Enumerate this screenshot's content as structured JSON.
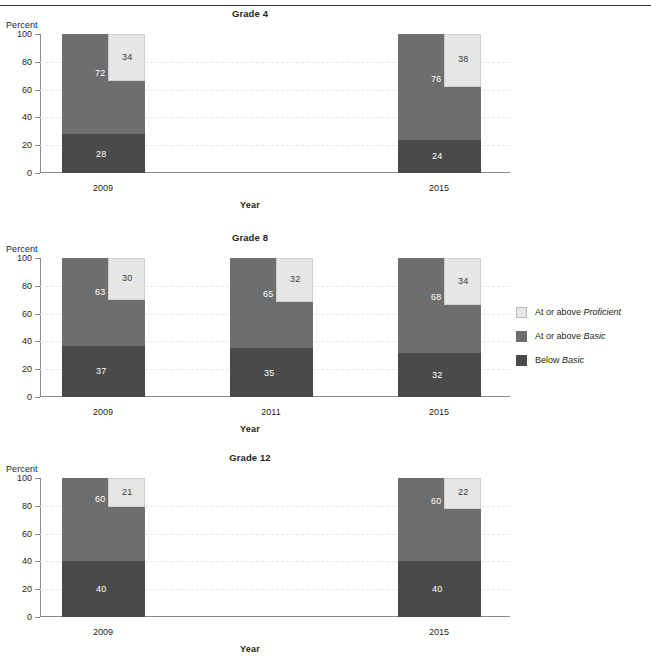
{
  "header": {
    "cut_text": ""
  },
  "legend": {
    "position": "right",
    "items": [
      {
        "id": "proficient",
        "label_plain": "At or above ",
        "label_italic": "Proficient",
        "color": "#e6e6e6",
        "swatch": "sw-prof"
      },
      {
        "id": "basic",
        "label_plain": "At or above ",
        "label_italic": "Basic",
        "color": "#6e6e6e",
        "swatch": "sw-basic"
      },
      {
        "id": "below",
        "label_plain": "Below ",
        "label_italic": "Basic",
        "color": "#4a4a4a",
        "swatch": "sw-below"
      }
    ]
  },
  "axis": {
    "ylabel": "Percent",
    "xlabel": "Year",
    "yticks": [
      100,
      80,
      60,
      40,
      20,
      0
    ],
    "ylim": [
      0,
      100
    ]
  },
  "panels": [
    {
      "id": "grade-4",
      "title": "Grade 4",
      "ylabel": "Percent",
      "xlabel": "Year",
      "categories": [
        "2009",
        "2015"
      ],
      "bars": [
        {
          "year": "2009",
          "below_basic": 28,
          "at_above_basic": 72,
          "at_above_proficient": 34
        },
        {
          "year": "2015",
          "below_basic": 24,
          "at_above_basic": 76,
          "at_above_proficient": 38
        }
      ]
    },
    {
      "id": "grade-8",
      "title": "Grade 8",
      "ylabel": "Percent",
      "xlabel": "Year",
      "categories": [
        "2009",
        "2011",
        "2015"
      ],
      "bars": [
        {
          "year": "2009",
          "below_basic": 37,
          "at_above_basic": 63,
          "at_above_proficient": 30
        },
        {
          "year": "2011",
          "below_basic": 35,
          "at_above_basic": 65,
          "at_above_proficient": 32
        },
        {
          "year": "2015",
          "below_basic": 32,
          "at_above_basic": 68,
          "at_above_proficient": 34
        }
      ]
    },
    {
      "id": "grade-12",
      "title": "Grade 12",
      "ylabel": "Percent",
      "xlabel": "Year",
      "categories": [
        "2009",
        "2015"
      ],
      "bars": [
        {
          "year": "2009",
          "below_basic": 40,
          "at_above_basic": 60,
          "at_above_proficient": 21
        },
        {
          "year": "2015",
          "below_basic": 40,
          "at_above_basic": 60,
          "at_above_proficient": 22
        }
      ]
    }
  ],
  "chart_data": {
    "type": "bar",
    "title": "",
    "subcharts": [
      {
        "title": "Grade 4",
        "categories": [
          "2009",
          "2015"
        ],
        "series": [
          {
            "name": "Below Basic",
            "values": [
              28,
              24
            ],
            "color": "#4a4a4a"
          },
          {
            "name": "At or above Basic",
            "values": [
              72,
              76
            ],
            "color": "#6e6e6e"
          },
          {
            "name": "At or above Proficient",
            "values": [
              34,
              38
            ],
            "color": "#e6e6e6"
          }
        ]
      },
      {
        "title": "Grade 8",
        "categories": [
          "2009",
          "2011",
          "2015"
        ],
        "series": [
          {
            "name": "Below Basic",
            "values": [
              37,
              35,
              32
            ],
            "color": "#4a4a4a"
          },
          {
            "name": "At or above Basic",
            "values": [
              63,
              65,
              68
            ],
            "color": "#6e6e6e"
          },
          {
            "name": "At or above Proficient",
            "values": [
              30,
              32,
              34
            ],
            "color": "#e6e6e6"
          }
        ]
      },
      {
        "title": "Grade 12",
        "categories": [
          "2009",
          "2015"
        ],
        "series": [
          {
            "name": "Below Basic",
            "values": [
              40,
              40
            ],
            "color": "#4a4a4a"
          },
          {
            "name": "At or above Basic",
            "values": [
              60,
              60
            ],
            "color": "#6e6e6e"
          },
          {
            "name": "At or above Proficient",
            "values": [
              21,
              22
            ],
            "color": "#e6e6e6"
          }
        ]
      }
    ],
    "xlabel": "Year",
    "ylabel": "Percent",
    "ylim": [
      0,
      100
    ],
    "yticks": [
      0,
      20,
      40,
      60,
      80,
      100
    ],
    "grid": true,
    "stacked": true,
    "legend": [
      "At or above Proficient",
      "At or above Basic",
      "Below Basic"
    ],
    "legend_position": "right"
  }
}
